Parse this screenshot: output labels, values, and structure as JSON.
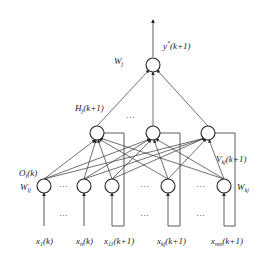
{
  "diagram": {
    "type": "recurrent neural network (Elman-style) diagram",
    "output": {
      "label_main": "y",
      "label_sup": "*",
      "label_arg": "(k+1)",
      "weight_label_main": "W",
      "weight_label_sub": "j"
    },
    "hidden": {
      "label_main": "H",
      "label_sub": "j",
      "label_arg": "(k+1)",
      "count_shown": 3,
      "ellipsis": "···"
    },
    "hidden_to_context": {
      "label_main": "V",
      "label_sub": "kj",
      "label_arg": "(k+1)"
    },
    "input_layer": {
      "output_label_main": "O",
      "output_label_sub": "i",
      "output_label_arg": "(k)",
      "weight_ij_main": "W",
      "weight_ij_sub": "ij",
      "weight_kj_main": "W",
      "weight_kj_sub": "kj",
      "ellipsis": "···"
    },
    "inputs": [
      {
        "main": "x",
        "sub": "1",
        "arg": "(k)"
      },
      {
        "main": "x",
        "sub": "n",
        "arg": "(k)"
      },
      {
        "main": "x",
        "sub": "11",
        "arg": "(k+1)"
      },
      {
        "main": "x",
        "sub": "kj",
        "arg": "(k+1)"
      },
      {
        "main": "x",
        "sub": "mn",
        "arg": "(k+1)"
      }
    ]
  }
}
